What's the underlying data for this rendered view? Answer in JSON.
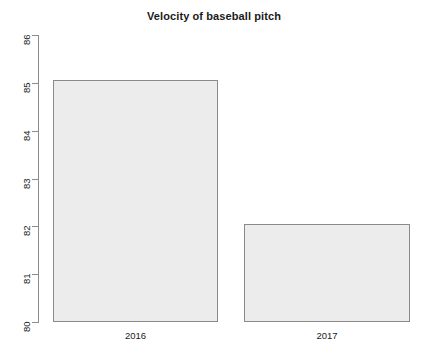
{
  "chart_data": {
    "type": "bar",
    "title": "Velocity of baseball pitch",
    "xlabel": "",
    "ylabel": "",
    "categories": [
      "2016",
      "2017"
    ],
    "values": [
      85.05,
      82.05
    ],
    "ylim": [
      80,
      86
    ],
    "yticks": [
      "80",
      "81",
      "82",
      "83",
      "84",
      "85",
      "86"
    ],
    "ytick_values": [
      80,
      81,
      82,
      83,
      84,
      85,
      86
    ],
    "grid": false,
    "legend": null,
    "bar_fill_color": "#ececec",
    "bar_border_color": "#8a8a8a",
    "axis_color": "#8c8c8c",
    "text_color": "#1a1a1a",
    "background_color": "#ffffff",
    "ytick_label_rotation": 90
  },
  "axis": {
    "y": {
      "ticks": [
        {
          "label": "86",
          "value": 86
        },
        {
          "label": "85",
          "value": 85
        },
        {
          "label": "84",
          "value": 84
        },
        {
          "label": "83",
          "value": 83
        },
        {
          "label": "82",
          "value": 82
        },
        {
          "label": "81",
          "value": 81
        },
        {
          "label": "80",
          "value": 80
        }
      ]
    }
  },
  "bars": [
    {
      "category": "2016",
      "value": 85.05
    },
    {
      "category": "2017",
      "value": 82.05
    }
  ]
}
